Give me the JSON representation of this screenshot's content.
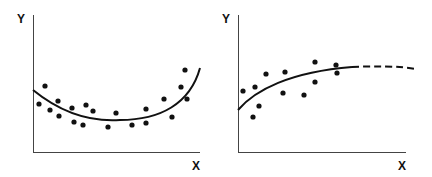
{
  "chart_data": [
    {
      "type": "scatter",
      "title": "",
      "xlabel": "X",
      "ylabel": "Y",
      "grid": false,
      "legend": null,
      "description": "Scatter points with U-shaped (quadratic) fitted curve",
      "points_px": [
        [
          39,
          104
        ],
        [
          45,
          86
        ],
        [
          50,
          110
        ],
        [
          58,
          101
        ],
        [
          59,
          116
        ],
        [
          72,
          108
        ],
        [
          74,
          122
        ],
        [
          83,
          125
        ],
        [
          86,
          105
        ],
        [
          93,
          111
        ],
        [
          108,
          127
        ],
        [
          116,
          113
        ],
        [
          132,
          125
        ],
        [
          146,
          109
        ],
        [
          146,
          123
        ],
        [
          164,
          99
        ],
        [
          172,
          117
        ],
        [
          181,
          87
        ],
        [
          185,
          70
        ],
        [
          187,
          99
        ]
      ],
      "fit_curve": {
        "style": "solid",
        "shape": "U-shaped quadratic"
      }
    },
    {
      "type": "scatter",
      "title": "",
      "xlabel": "X",
      "ylabel": "Y",
      "grid": false,
      "legend": null,
      "description": "Scatter points with saturating (logarithmic) fitted curve, extrapolated as dashed line",
      "points_px": [
        [
          243,
          91
        ],
        [
          253,
          117
        ],
        [
          255,
          87
        ],
        [
          259,
          106
        ],
        [
          266,
          74
        ],
        [
          283,
          93
        ],
        [
          285,
          72
        ],
        [
          304,
          95
        ],
        [
          315,
          62
        ],
        [
          315,
          82
        ],
        [
          336,
          65
        ],
        [
          337,
          73
        ]
      ],
      "fit_curve": {
        "style": "solid then dashed",
        "shape": "saturating/plateau"
      }
    }
  ],
  "left_chart": {
    "x_label": "X",
    "y_label": "Y"
  },
  "right_chart": {
    "x_label": "X",
    "y_label": "Y"
  },
  "colors": {
    "ink": "#111111",
    "background": "#ffffff"
  }
}
